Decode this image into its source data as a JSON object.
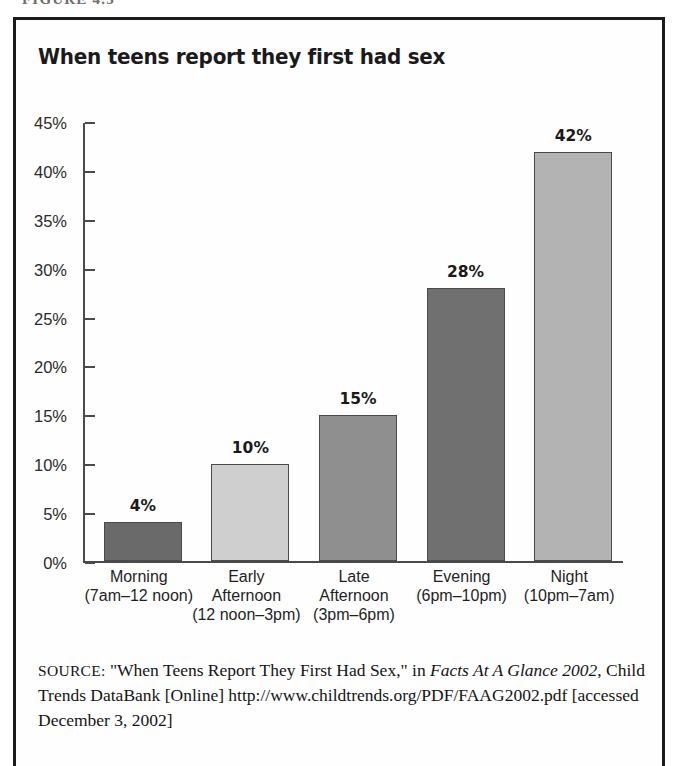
{
  "figure": {
    "header_label": "FIGURE 4.5"
  },
  "chart_title": "When teens report they first had sex",
  "chart_data": {
    "type": "bar",
    "title": "When teens report they first had sex",
    "xlabel": "",
    "ylabel": "",
    "ylim": [
      0,
      45
    ],
    "grid": false,
    "legend": "none",
    "axis_tick_suffix": "%",
    "ytick_labels": [
      "45%",
      "40%",
      "35%",
      "30%",
      "25%",
      "20%",
      "15%",
      "10%",
      "5%",
      "0%"
    ],
    "ytick_values": [
      45,
      40,
      35,
      30,
      25,
      20,
      15,
      10,
      5,
      0
    ],
    "categories": [
      "Morning (7am–12 noon)",
      "Early Afternoon (12 noon–3pm)",
      "Late Afternoon (3pm–6pm)",
      "Evening (6pm–10pm)",
      "Night (10pm–7am)"
    ],
    "values": [
      4,
      10,
      15,
      28,
      42
    ],
    "data_labels": [
      "4%",
      "10%",
      "15%",
      "28%",
      "42%"
    ],
    "bar_colors": [
      "#6a6a6a",
      "#cfcfcf",
      "#8f8f8f",
      "#707070",
      "#b3b3b3"
    ],
    "bar_edge_color": "#4a4a4a",
    "axis_color": "#4a4a4a",
    "background": "#ffffff"
  },
  "category_labels": [
    {
      "line1": "Morning",
      "line2": "(7am–12 noon)",
      "line3": ""
    },
    {
      "line1": "Early",
      "line2": "Afternoon",
      "line3": "(12 noon–3pm)"
    },
    {
      "line1": "Late",
      "line2": "Afternoon",
      "line3": "(3pm–6pm)"
    },
    {
      "line1": "Evening",
      "line2": "(6pm–10pm)",
      "line3": ""
    },
    {
      "line1": "Night",
      "line2": "(10pm–7am)",
      "line3": ""
    }
  ],
  "source": {
    "label": "SOURCE:",
    "part1": " \"When Teens Report They First Had Sex,\" in ",
    "italic1": "Facts At A Glance 2002",
    "part2": ", Child Trends DataBank [Online] http://www.childtrends.org/PDF/FAAG2002.pdf [accessed December 3, 2002]"
  }
}
